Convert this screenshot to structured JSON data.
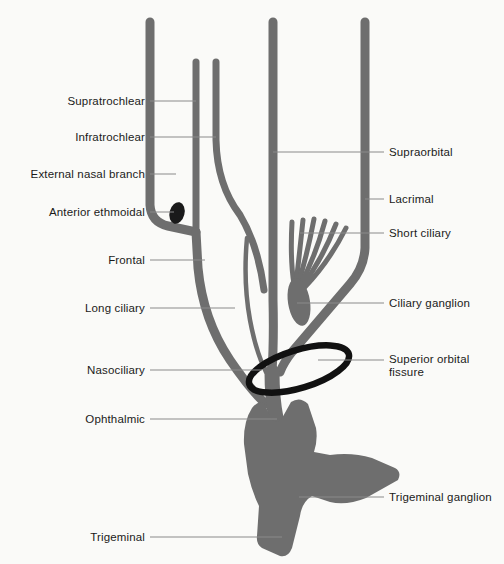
{
  "figure": {
    "background_color": "#fafaf8",
    "nerve_color": "#6e6e6e",
    "nerve_outline_color": "#5d5d5d",
    "accent_dark_color": "#1a1a1a",
    "leader_line_color": "#8a8a8a",
    "label_text_color": "#1a1a1a",
    "width": 504,
    "height": 564
  },
  "labels_left": [
    {
      "id": "supratrochlear",
      "text": "Supratrochlear",
      "text_x": 145,
      "text_y": 101,
      "line_x1": 150,
      "line_y1": 101,
      "line_x2": 196,
      "line_y2": 101
    },
    {
      "id": "infratrochlear",
      "text": "Infratrochlear",
      "text_x": 145,
      "text_y": 137,
      "line_x1": 150,
      "line_y1": 137,
      "line_x2": 216,
      "line_y2": 137
    },
    {
      "id": "external-nasal-branch",
      "text": "External nasal branch",
      "text_x": 145,
      "text_y": 174,
      "line_x1": 150,
      "line_y1": 174,
      "line_x2": 176,
      "line_y2": 174
    },
    {
      "id": "anterior-ethmoidal",
      "text": "Anterior ethmoidal",
      "text_x": 145,
      "text_y": 212,
      "line_x1": 150,
      "line_y1": 212,
      "line_x2": 174,
      "line_y2": 212
    },
    {
      "id": "frontal",
      "text": "Frontal",
      "text_x": 145,
      "text_y": 260,
      "line_x1": 150,
      "line_y1": 260,
      "line_x2": 205,
      "line_y2": 260
    },
    {
      "id": "long-ciliary",
      "text": "Long ciliary",
      "text_x": 145,
      "text_y": 308,
      "line_x1": 150,
      "line_y1": 308,
      "line_x2": 235,
      "line_y2": 308
    },
    {
      "id": "nasociliary",
      "text": "Nasociliary",
      "text_x": 145,
      "text_y": 370,
      "line_x1": 150,
      "line_y1": 370,
      "line_x2": 262,
      "line_y2": 370
    },
    {
      "id": "ophthalmic",
      "text": "Ophthalmic",
      "text_x": 145,
      "text_y": 419,
      "line_x1": 150,
      "line_y1": 419,
      "line_x2": 277,
      "line_y2": 419
    },
    {
      "id": "trigeminal",
      "text": "Trigeminal",
      "text_x": 145,
      "text_y": 537,
      "line_x1": 150,
      "line_y1": 537,
      "line_x2": 282,
      "line_y2": 537
    }
  ],
  "labels_right": [
    {
      "id": "supraorbital",
      "text": "Supraorbital",
      "text_x": 389,
      "text_y": 152,
      "line_x1": 273,
      "line_y1": 152,
      "line_x2": 384,
      "line_y2": 152
    },
    {
      "id": "lacrimal",
      "text": "Lacrimal",
      "text_x": 389,
      "text_y": 199,
      "line_x1": 365,
      "line_y1": 199,
      "line_x2": 384,
      "line_y2": 199
    },
    {
      "id": "short-ciliary",
      "text": "Short ciliary",
      "text_x": 389,
      "text_y": 233,
      "line_x1": 300,
      "line_y1": 233,
      "line_x2": 384,
      "line_y2": 233
    },
    {
      "id": "ciliary-ganglion",
      "text": "Ciliary ganglion",
      "text_x": 389,
      "text_y": 303,
      "line_x1": 297,
      "line_y1": 303,
      "line_x2": 384,
      "line_y2": 303
    },
    {
      "id": "superior-orbital-fissure",
      "text": "Superior orbital\nfissure",
      "text_x": 389,
      "text_y": 366,
      "line_x1": 318,
      "line_y1": 360,
      "line_x2": 384,
      "line_y2": 360
    },
    {
      "id": "trigeminal-ganglion",
      "text": "Trigeminal ganglion",
      "text_x": 389,
      "text_y": 497,
      "line_x1": 299,
      "line_y1": 497,
      "line_x2": 384,
      "line_y2": 497
    }
  ],
  "structures": {
    "supratrochlear_branch": "vertical branch, tip at top-left, x=150",
    "infratrochlear_branch": "short vertical branch, x=196",
    "external_nasal_branch": "short vertical branch, x=216",
    "anterior_ethmoidal_nodule": "dark oval nodule at junction x=176 y=213",
    "frontal_nerve": "long vertical trunk x=273 descending to ophthalmic",
    "supraorbital_branch": "vertical trunk x=273 from top",
    "lacrimal_nerve": "vertical trunk x=365 descending then angling left",
    "short_ciliary_nerves": "fan of 6 prongs above ciliary ganglion",
    "ciliary_ganglion": "elongated swelling at x=297 y=300",
    "long_ciliary_nerve": "thin curved branch from nasociliary",
    "nasociliary_nerve": "main trunk curving down to ophthalmic",
    "ophthalmic_nerve": "thick trunk below fissure",
    "superior_orbital_fissure": "dark rotated ellipse ring around trunk",
    "trigeminal_ganglion": "large gray blob with maxillary and mandibular branches",
    "trigeminal_root": "inferior stem of the ganglion"
  }
}
